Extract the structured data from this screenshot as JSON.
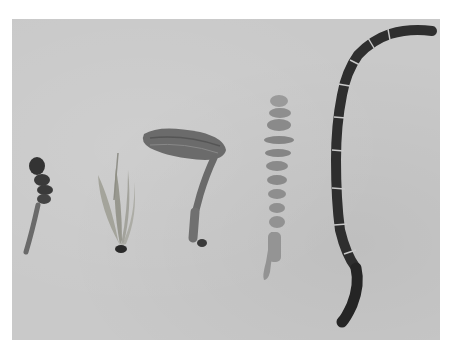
{
  "image": {
    "description": "Black-and-white photograph of five insect antennae specimens on a grey background",
    "background_color": "#c9c9c9",
    "frame_color": "#ffffff",
    "specimens": [
      {
        "id": "specimen-1",
        "type": "capitate/lamellate antenna",
        "tone": "#3a3a3a"
      },
      {
        "id": "specimen-2",
        "type": "plumose/aristate antenna",
        "tone": "#8a8a80"
      },
      {
        "id": "specimen-3",
        "type": "clubbed geniculate antenna",
        "tone": "#6a6a6a"
      },
      {
        "id": "specimen-4",
        "type": "serrate antenna",
        "tone": "#8e8e8e"
      },
      {
        "id": "specimen-5",
        "type": "filiform/moniliform segmented antenna",
        "tone": "#2a2a2a"
      }
    ]
  }
}
